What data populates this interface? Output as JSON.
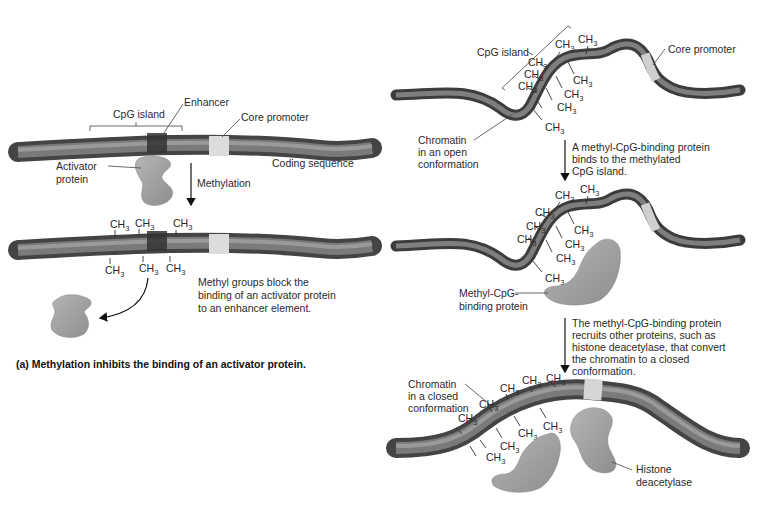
{
  "panel_a": {
    "top_dna": {
      "cpg_island_label": "CpG island",
      "enhancer_label": "Enhancer",
      "core_promoter_label": "Core promoter",
      "coding_sequence_label": "Coding sequence",
      "activator_label_line1": "Activator",
      "activator_label_line2": "protein"
    },
    "step_arrow_label": "Methylation",
    "bottom_dna": {
      "methyl_groups_top": [
        "CH3",
        "CH3",
        "CH3"
      ],
      "methyl_groups_bottom": [
        "CH3",
        "CH3",
        "CH3"
      ],
      "note_line1": "Methyl groups block the",
      "note_line2": "binding of an activator protein",
      "note_line3": "to an enhancer element."
    },
    "caption": "(a) Methylation inhibits the binding of an activator protein."
  },
  "panel_b": {
    "stage1": {
      "cpg_island_label": "CpG island",
      "core_promoter_label": "Core promoter",
      "chromatin_label_line1": "Chromatin",
      "chromatin_label_line2": "in an open",
      "chromatin_label_line3": "conformation",
      "methyl_count": 10
    },
    "step1_text": [
      "A methyl-CpG-binding protein",
      "binds to the methylated",
      "CpG island."
    ],
    "stage2": {
      "mbp_label_line1": "Methyl-CpG-",
      "mbp_label_line2": "binding protein",
      "methyl_count": 10
    },
    "step2_text": [
      "The methyl-CpG-binding protein",
      "recruits other proteins, such as",
      "histone deacetylase, that convert",
      "the chromatin to a closed",
      "conformation."
    ],
    "stage3": {
      "chromatin_label_line1": "Chromatin",
      "chromatin_label_line2": "in a closed",
      "chromatin_label_line3": "conformation",
      "hdac_label_line1": "Histone",
      "hdac_label_line2": "deacetylase",
      "methyl_count": 10
    }
  },
  "methyl_text": {
    "ch": "CH",
    "sub": "3"
  },
  "colors": {
    "dna_dark": "#4a4a4a",
    "dna_mid": "#7a7a7a",
    "dna_light": "#a8a8a8",
    "enhancer": "#3a3a3a",
    "promoter": "#d8d8d8",
    "protein": "#9c9c9c",
    "background": "#ffffff"
  }
}
